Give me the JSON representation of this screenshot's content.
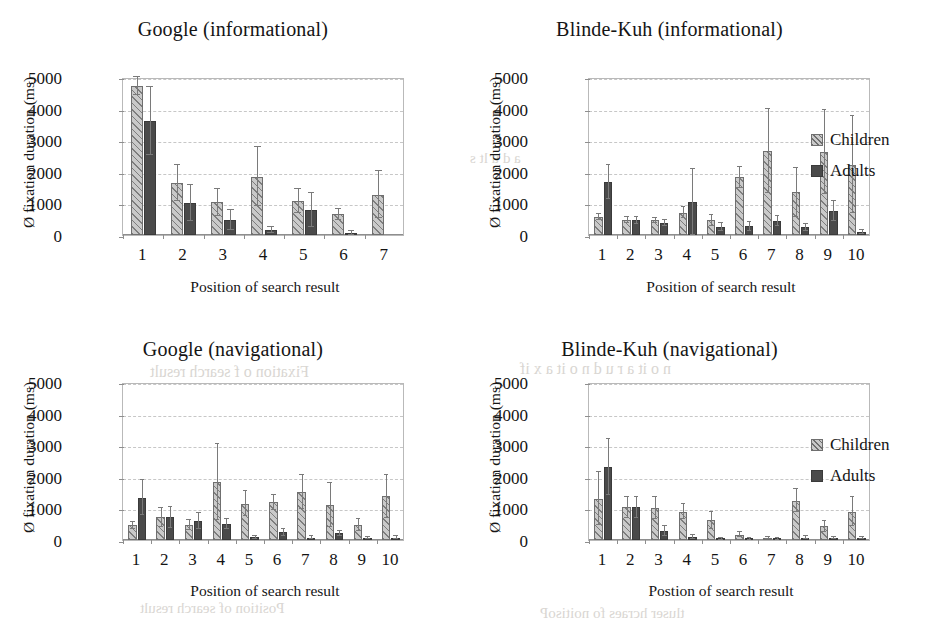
{
  "legend": {
    "children_label": "Children",
    "adults_label": "Adults",
    "children_color": "#c9c9c9",
    "adults_color": "#4a4a4a"
  },
  "axis": {
    "yticks": [
      "0",
      "1000",
      "2000",
      "3000",
      "4000",
      "5000"
    ],
    "ylabel": "Ø fixation duration (ms)",
    "ylim_min": 0,
    "ylim_max": 5000
  },
  "ghost_text": [
    {
      "text": "Childre  n  a  s    t  ie  nt",
      "x": 140,
      "y": 96,
      "size": 15
    },
    {
      "text": "a    d  u  lt    s",
      "x": 470,
      "y": 150,
      "size": 15
    },
    {
      "text": "Fixation  o  f  search  result",
      "x": 150,
      "y": 363,
      "size": 16
    },
    {
      "text": "n  o  it  a  r  u  d  n  o  it  a  x  if",
      "x": 520,
      "y": 360,
      "size": 16
    },
    {
      "text": "Position  of  search  result",
      "x": 140,
      "y": 600,
      "size": 15
    },
    {
      "text": "tluser  hcraes  fo  noitisoP",
      "x": 540,
      "y": 605,
      "size": 15
    }
  ],
  "chart_data": [
    {
      "id": "google-informational",
      "type": "bar",
      "title": "Google (informational)",
      "xlabel": "Position of search result",
      "ylabel": "Ø fixation duration (ms)",
      "ylim": [
        0,
        5000
      ],
      "yticks": [
        0,
        1000,
        2000,
        3000,
        4000,
        5000
      ],
      "grid": true,
      "legend_position": "none",
      "categories": [
        "1",
        "2",
        "3",
        "4",
        "5",
        "6",
        "7"
      ],
      "series": [
        {
          "name": "Children",
          "values": [
            4720,
            1640,
            1030,
            1840,
            1080,
            650,
            1280
          ],
          "errors": [
            280,
            560,
            420,
            930,
            380,
            180,
            740
          ]
        },
        {
          "name": "Adults",
          "values": [
            3600,
            1010,
            470,
            160,
            790,
            70,
            null
          ],
          "errors": [
            1070,
            560,
            310,
            100,
            540,
            60,
            null
          ]
        }
      ]
    },
    {
      "id": "blinde-kuh-informational",
      "type": "bar",
      "title": "Blinde-Kuh (informational)",
      "xlabel": "Position of search result",
      "ylabel": "Ø fixation duration (ms)",
      "ylim": [
        0,
        5000
      ],
      "yticks": [
        0,
        1000,
        2000,
        3000,
        4000,
        5000
      ],
      "grid": true,
      "legend_position": "right",
      "categories": [
        "1",
        "2",
        "3",
        "4",
        "5",
        "6",
        "7",
        "8",
        "9",
        "10"
      ],
      "series": [
        {
          "name": "Children",
          "values": [
            570,
            480,
            460,
            710,
            460,
            1830,
            2660,
            1350,
            2630,
            2230
          ],
          "errors": [
            110,
            90,
            70,
            180,
            180,
            330,
            1340,
            780,
            1320,
            1530
          ]
        },
        {
          "name": "Adults",
          "values": [
            1690,
            460,
            390,
            1040,
            260,
            270,
            440,
            250,
            760,
            90
          ],
          "errors": [
            540,
            120,
            90,
            1050,
            130,
            130,
            170,
            110,
            330,
            60
          ]
        }
      ]
    },
    {
      "id": "google-navigational",
      "type": "bar",
      "title": "Google (navigational)",
      "xlabel": "Position of search result",
      "ylabel": "Ø fixation duration (ms)",
      "ylim": [
        0,
        5000
      ],
      "yticks": [
        0,
        1000,
        2000,
        3000,
        4000,
        5000
      ],
      "grid": true,
      "legend_position": "none",
      "categories": [
        "1",
        "2",
        "3",
        "4",
        "5",
        "6",
        "7",
        "8",
        "9",
        "10"
      ],
      "series": [
        {
          "name": "Children",
          "values": [
            460,
            720,
            470,
            1830,
            1150,
            1190,
            1530,
            1110,
            480,
            1380
          ],
          "errors": [
            120,
            300,
            160,
            1210,
            400,
            250,
            540,
            700,
            190,
            680
          ]
        },
        {
          "name": "Adults",
          "values": [
            1340,
            720,
            600,
            510,
            80,
            250,
            70,
            220,
            60,
            70
          ],
          "errors": [
            560,
            340,
            260,
            160,
            60,
            110,
            50,
            80,
            40,
            50
          ]
        }
      ]
    },
    {
      "id": "blinde-kuh-navigational",
      "type": "bar",
      "title": "Blinde-Kuh (navigational)",
      "xlabel": "Postion of search result",
      "ylabel": "Ø fixation duration (ms)",
      "ylim": [
        0,
        5000
      ],
      "yticks": [
        0,
        1000,
        2000,
        3000,
        4000,
        5000
      ],
      "grid": true,
      "legend_position": "right",
      "categories": [
        "1",
        "2",
        "3",
        "4",
        "5",
        "6",
        "7",
        "8",
        "9",
        "10"
      ],
      "series": [
        {
          "name": "Children",
          "values": [
            1300,
            1030,
            1020,
            890,
            620,
            160,
            60,
            1250,
            430,
            900
          ],
          "errors": [
            840,
            340,
            350,
            240,
            280,
            80,
            30,
            350,
            180,
            470
          ]
        },
        {
          "name": "Adults",
          "values": [
            2320,
            1040,
            280,
            90,
            30,
            40,
            30,
            70,
            60,
            70
          ],
          "errors": [
            880,
            330,
            160,
            70,
            30,
            30,
            20,
            50,
            40,
            40
          ]
        }
      ]
    }
  ]
}
